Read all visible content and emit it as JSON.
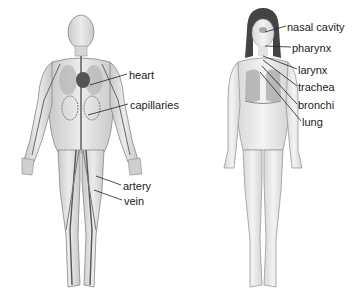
{
  "figures": [
    {
      "name": "circulatory-system",
      "labels": [
        {
          "text": "heart",
          "x": 129,
          "y": 69
        },
        {
          "text": "capillaries",
          "x": 130,
          "y": 99
        },
        {
          "text": "artery",
          "x": 123,
          "y": 180
        },
        {
          "text": "vein",
          "x": 124,
          "y": 195
        }
      ]
    },
    {
      "name": "respiratory-system",
      "labels": [
        {
          "text": "nasal cavity",
          "x": 287,
          "y": 21
        },
        {
          "text": "pharynx",
          "x": 292,
          "y": 42
        },
        {
          "text": "larynx",
          "x": 298,
          "y": 64
        },
        {
          "text": "trachea",
          "x": 298,
          "y": 81
        },
        {
          "text": "bronchi",
          "x": 298,
          "y": 99
        },
        {
          "text": "lung",
          "x": 302,
          "y": 116
        }
      ]
    }
  ]
}
